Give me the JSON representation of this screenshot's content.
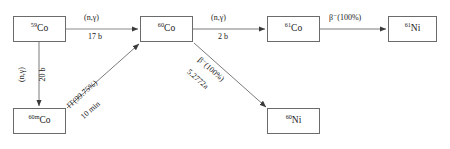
{
  "diagram": {
    "type": "flow-diagram",
    "background_color": "#ffffff",
    "line_color": "#6b6b6b",
    "text_color": "#1a1a1a",
    "nodes": [
      {
        "id": "co59",
        "name": "cobalt-59",
        "mass_number": "59",
        "symbol": "Co",
        "x": 13,
        "y": 16,
        "w": 53,
        "h": 26
      },
      {
        "id": "co60m",
        "name": "cobalt-60m",
        "mass_number": "60m",
        "symbol": "Co",
        "x": 13,
        "y": 108,
        "w": 53,
        "h": 26
      },
      {
        "id": "co60",
        "name": "cobalt-60",
        "mass_number": "60",
        "symbol": "Co",
        "x": 140,
        "y": 16,
        "w": 53,
        "h": 26
      },
      {
        "id": "co61",
        "name": "cobalt-61",
        "mass_number": "61",
        "symbol": "Co",
        "x": 267,
        "y": 16,
        "w": 53,
        "h": 26
      },
      {
        "id": "ni61",
        "name": "nickel-61",
        "mass_number": "61",
        "symbol": "Ni",
        "x": 388,
        "y": 16,
        "w": 49,
        "h": 26
      },
      {
        "id": "ni60",
        "name": "nickel-60",
        "mass_number": "60",
        "symbol": "Ni",
        "x": 267,
        "y": 108,
        "w": 53,
        "h": 26
      }
    ],
    "edges": [
      {
        "id": "co59-to-co60",
        "name": "neutron-capture-co59-co60",
        "from": "co59",
        "to": "co60",
        "reaction": "(n,γ)",
        "value": "17 b",
        "orientation": "horizontal"
      },
      {
        "id": "co59-to-co60m",
        "name": "neutron-capture-co59-co60m",
        "from": "co59",
        "to": "co60m",
        "reaction": "(n,γ)",
        "value": "20 b",
        "orientation": "vertical"
      },
      {
        "id": "co60m-to-co60",
        "name": "isomeric-transition-co60m-co60",
        "from": "co60m",
        "to": "co60",
        "reaction": "IT(99.75%)",
        "value": "10 min",
        "orientation": "diagonal-up"
      },
      {
        "id": "co60-to-co61",
        "name": "neutron-capture-co60-co61",
        "from": "co60",
        "to": "co61",
        "reaction": "(n,γ)",
        "value": "2 b",
        "orientation": "horizontal"
      },
      {
        "id": "co60-to-ni60",
        "name": "beta-decay-co60-ni60",
        "from": "co60",
        "to": "ni60",
        "reaction": "β⁻(100%)",
        "value": "5.2772a",
        "orientation": "diagonal-down"
      },
      {
        "id": "co61-to-ni61",
        "name": "beta-decay-co61-ni61",
        "from": "co61",
        "to": "ni61",
        "reaction": "β⁻(100%)",
        "value": "",
        "orientation": "horizontal"
      }
    ]
  }
}
